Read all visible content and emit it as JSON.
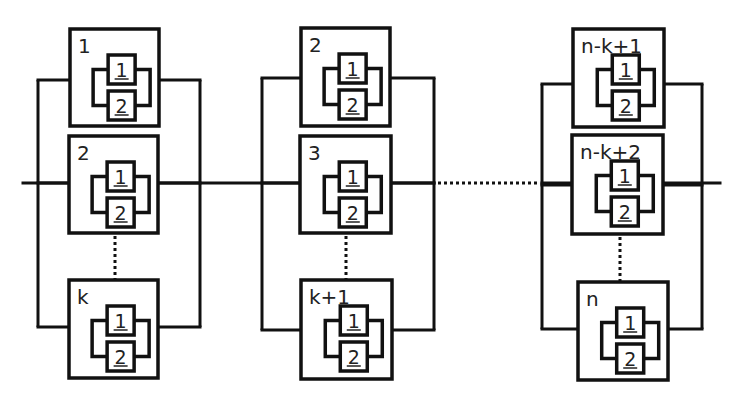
{
  "diagram": {
    "type": "series-parallel reliability block diagram",
    "main_line": {
      "y": 183,
      "x_start": 23,
      "x_end": 720
    },
    "series_gap": {
      "x_start": 434,
      "x_end": 542,
      "style": "dotted"
    },
    "groups": [
      {
        "rail_left_x": 38,
        "rail_right_x": 200,
        "blocks": [
          {
            "label": "1",
            "x": 70,
            "y": 29,
            "w": 89,
            "h": 97,
            "rail_y": 80
          },
          {
            "label": "2",
            "x": 69,
            "y": 136,
            "w": 89,
            "h": 97,
            "rail_y": 183
          },
          {
            "label": "k",
            "x": 69,
            "y": 280,
            "w": 89,
            "h": 98,
            "rail_y": 327
          }
        ],
        "ellipsis": {
          "x": 115,
          "y1": 236,
          "y2": 279
        }
      },
      {
        "rail_left_x": 262,
        "rail_right_x": 434,
        "blocks": [
          {
            "label": "2",
            "x": 301,
            "y": 28,
            "w": 89,
            "h": 98,
            "rail_y": 78
          },
          {
            "label": "3",
            "x": 300,
            "y": 136,
            "w": 91,
            "h": 97,
            "rail_y": 183
          },
          {
            "label": "k+1",
            "x": 301,
            "y": 280,
            "w": 91,
            "h": 99,
            "rail_y": 330
          }
        ],
        "ellipsis": {
          "x": 346,
          "y1": 236,
          "y2": 279
        }
      },
      {
        "rail_left_x": 542,
        "rail_right_x": 702,
        "blocks": [
          {
            "label": "n-k+1",
            "x": 573,
            "y": 29,
            "w": 91,
            "h": 98,
            "rail_y": 84
          },
          {
            "label": "n-k+2",
            "x": 572,
            "y": 135,
            "w": 91,
            "h": 99,
            "rail_y": 185
          },
          {
            "label": "n",
            "x": 578,
            "y": 282,
            "w": 90,
            "h": 98,
            "rail_y": 329
          }
        ],
        "ellipsis": {
          "x": 620,
          "y1": 237,
          "y2": 281
        }
      }
    ],
    "sub_components": [
      "1",
      "2"
    ],
    "colors": {
      "line": "#111111",
      "text": "#222222",
      "background": "#ffffff"
    }
  }
}
